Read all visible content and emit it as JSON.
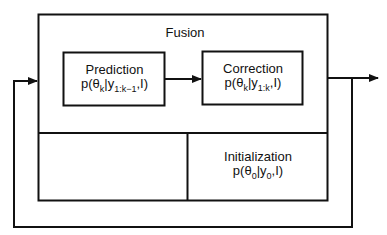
{
  "diagram": {
    "outer_box": {
      "label": "Fusion"
    },
    "prediction": {
      "title": "Prediction",
      "eq_p": "p(θ",
      "eq_sub1": "k",
      "eq_mid": "|y",
      "eq_sub2": "1:k−1",
      "eq_end": ",I)"
    },
    "correction": {
      "title": "Correction",
      "eq_p": "p(θ",
      "eq_sub1": "k",
      "eq_mid": "|y",
      "eq_sub2": "1:k",
      "eq_end": ",I)"
    },
    "initialization": {
      "title": "Initialization",
      "eq_p": "p(θ",
      "eq_sub1": "0",
      "eq_mid": "|y",
      "eq_sub2": "0",
      "eq_end": ",I)"
    },
    "connections": [
      {
        "from": "prediction",
        "to": "correction"
      },
      {
        "from": "fusion",
        "to": "output"
      },
      {
        "from": "output",
        "to": "fusion",
        "type": "feedback-loop"
      }
    ],
    "colors": {
      "line": "#111111",
      "background": "#ffffff"
    }
  }
}
